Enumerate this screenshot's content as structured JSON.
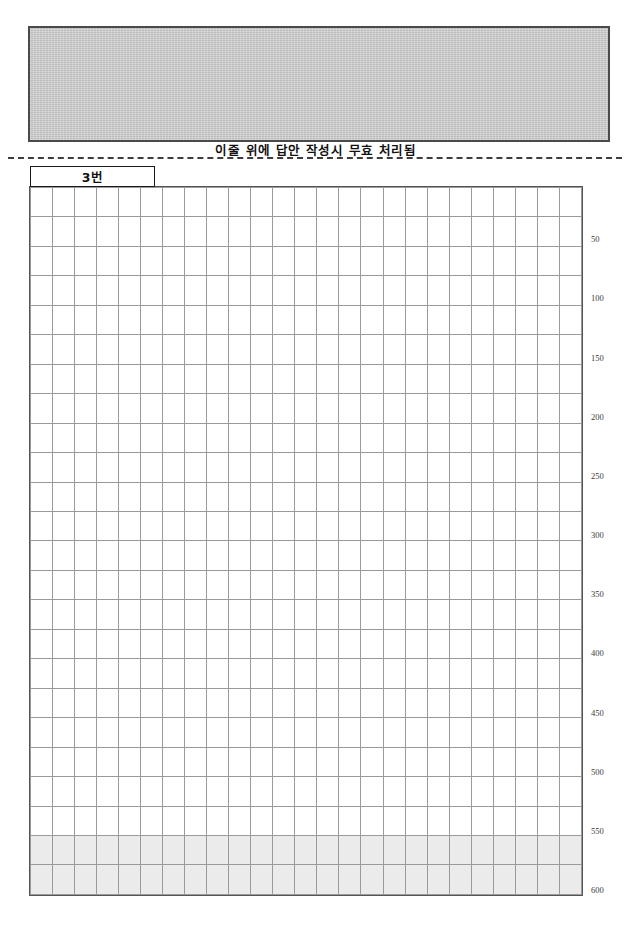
{
  "document": {
    "type": "korean-exam-answer-sheet",
    "page_width": 632,
    "page_height": 946
  },
  "masked_block": {
    "name": "redacted-identity-area",
    "fill_color": "#c5c5c5",
    "border_color": "#4a4a4a",
    "content": ""
  },
  "notice": {
    "text": "이줄 위에 답안 작성시 무효 처리됨"
  },
  "question": {
    "number_label": "3번"
  },
  "grid": {
    "columns": 25,
    "rows": 24,
    "shaded_rows_from": 23,
    "cell_border_color": "#9a9a9a",
    "outer_border_color": "#555555",
    "shaded_fill": "#ebebeb"
  },
  "count_ruler": {
    "unit_per_row": 25,
    "ticks": [
      {
        "row": 2,
        "label": "50"
      },
      {
        "row": 4,
        "label": "100"
      },
      {
        "row": 6,
        "label": "150"
      },
      {
        "row": 8,
        "label": "200"
      },
      {
        "row": 10,
        "label": "250"
      },
      {
        "row": 12,
        "label": "300"
      },
      {
        "row": 14,
        "label": "350"
      },
      {
        "row": 16,
        "label": "400"
      },
      {
        "row": 18,
        "label": "450"
      },
      {
        "row": 20,
        "label": "500"
      },
      {
        "row": 22,
        "label": "550"
      },
      {
        "row": 24,
        "label": "600"
      }
    ]
  }
}
